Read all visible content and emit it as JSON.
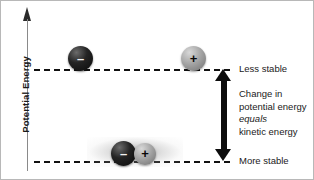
{
  "figure": {
    "axis": {
      "y_label": "Potential Energy",
      "arrow_icon": "axis-arrow-up-icon"
    },
    "levels": [
      {
        "id": "upper",
        "label": "Less stable"
      },
      {
        "id": "lower",
        "label": "More stable"
      }
    ],
    "annotation": {
      "line1": "Change in",
      "line2": "potential energy",
      "line3_italic": "equals",
      "line4": "kinetic energy"
    },
    "delta_arrow": {
      "icon": "double-headed-vertical-arrow-icon",
      "meaning": "Change in potential energy equals kinetic energy"
    },
    "particles": {
      "upper_left": {
        "charge": "–",
        "name": "negative-ion"
      },
      "upper_right": {
        "charge": "+",
        "name": "positive-ion"
      },
      "lower_left": {
        "charge": "–",
        "name": "negative-ion"
      },
      "lower_right": {
        "charge": "+",
        "name": "positive-ion"
      }
    },
    "colors": {
      "negative_particle": "#0a0a0a",
      "positive_particle": "#a6a6a6",
      "level_line": "#111111",
      "axis_line": "#8a8a8a",
      "arrow": "#0d0d0d",
      "text": "#1a1a1a",
      "background": "#ffffff",
      "border": "#b8b8b8"
    }
  }
}
